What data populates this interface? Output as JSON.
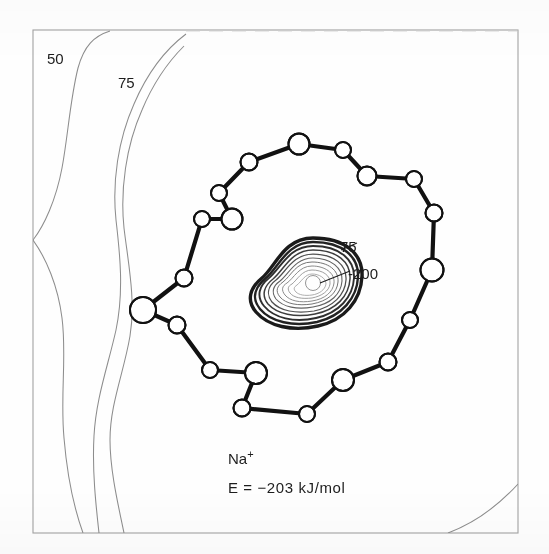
{
  "figure": {
    "kind": "contour-map-with-molecular-structure",
    "caption_species": "Na",
    "caption_charge": "+",
    "caption_energy": "E = −203 kJ/mol",
    "frame_color": "#9a9a9a",
    "bond_color": "#111111",
    "atom_fill": "#ffffff",
    "atom_stroke": "#111111",
    "contour_color": "#8d8d8d",
    "core_contour_color": "#1a1a1a"
  },
  "chart_data": {
    "type": "contour",
    "title": "",
    "xlabel": "",
    "ylabel": "",
    "units": "kJ/mol",
    "grid": false,
    "legend": "none",
    "annotations": [
      {
        "text": "50",
        "x": 56,
        "y": 57,
        "role": "contour-label",
        "leader": false
      },
      {
        "text": "75",
        "x": 126,
        "y": 81,
        "role": "contour-label",
        "leader": false
      },
      {
        "text": "75",
        "x": 346,
        "y": 247,
        "role": "contour-label",
        "leader": true
      },
      {
        "text": "-200",
        "x": 352,
        "y": 274,
        "role": "contour-label",
        "leader": true
      }
    ],
    "levels": [
      {
        "label": "50",
        "value": 50,
        "region": "outer-left",
        "style": "thin"
      },
      {
        "label": "75",
        "value": 75,
        "region": "outer-left",
        "style": "thin"
      },
      {
        "label": "75",
        "value": 75,
        "region": "core",
        "style": "thick"
      },
      {
        "label": "-200",
        "value": -200,
        "region": "core-center",
        "style": "thin"
      }
    ],
    "core_center": {
      "x": 313,
      "y": 283
    },
    "core_minimum_value": -200,
    "series": [
      {
        "name": "electrostatic potential contours",
        "values": [
          50,
          75,
          -200
        ]
      }
    ]
  },
  "structure": {
    "name": "crown-ether-macrocycle",
    "ring_size": 18,
    "atoms": [
      {
        "id": "O1",
        "element": "O",
        "x": 299,
        "y": 144,
        "r": 10.5
      },
      {
        "id": "C2",
        "element": "C",
        "x": 249,
        "y": 162,
        "r": 8.5
      },
      {
        "id": "C3",
        "element": "C",
        "x": 219,
        "y": 193,
        "r": 8.0
      },
      {
        "id": "O4",
        "element": "O",
        "x": 232,
        "y": 219,
        "r": 10.5
      },
      {
        "id": "C5",
        "element": "C",
        "x": 202,
        "y": 219,
        "r": 8.0
      },
      {
        "id": "C6",
        "element": "C",
        "x": 184,
        "y": 278,
        "r": 8.5
      },
      {
        "id": "O7",
        "element": "O",
        "x": 143,
        "y": 310,
        "r": 13.0
      },
      {
        "id": "C8",
        "element": "C",
        "x": 177,
        "y": 325,
        "r": 8.5
      },
      {
        "id": "C9",
        "element": "C",
        "x": 210,
        "y": 370,
        "r": 8.0
      },
      {
        "id": "O10",
        "element": "O",
        "x": 256,
        "y": 373,
        "r": 11.0
      },
      {
        "id": "C11",
        "element": "C",
        "x": 242,
        "y": 408,
        "r": 8.5
      },
      {
        "id": "C12",
        "element": "C",
        "x": 307,
        "y": 414,
        "r": 8.0
      },
      {
        "id": "O13",
        "element": "O",
        "x": 343,
        "y": 380,
        "r": 11.0
      },
      {
        "id": "C14",
        "element": "C",
        "x": 388,
        "y": 362,
        "r": 8.5
      },
      {
        "id": "C15",
        "element": "C",
        "x": 410,
        "y": 320,
        "r": 8.0
      },
      {
        "id": "O16",
        "element": "O",
        "x": 432,
        "y": 270,
        "r": 11.5
      },
      {
        "id": "C17",
        "element": "C",
        "x": 434,
        "y": 213,
        "r": 8.5
      },
      {
        "id": "C18",
        "element": "C",
        "x": 414,
        "y": 179,
        "r": 8.0
      },
      {
        "id": "C19",
        "element": "C",
        "x": 367,
        "y": 176,
        "r": 9.5
      },
      {
        "id": "C20",
        "element": "C",
        "x": 343,
        "y": 150,
        "r": 8.0
      }
    ],
    "bonds": [
      [
        "O1",
        "C2"
      ],
      [
        "C2",
        "C3"
      ],
      [
        "C3",
        "O4"
      ],
      [
        "O4",
        "C5"
      ],
      [
        "C5",
        "C6"
      ],
      [
        "C6",
        "O7"
      ],
      [
        "O7",
        "C8"
      ],
      [
        "C8",
        "C9"
      ],
      [
        "C9",
        "O10"
      ],
      [
        "O10",
        "C11"
      ],
      [
        "C11",
        "C12"
      ],
      [
        "C12",
        "O13"
      ],
      [
        "O13",
        "C14"
      ],
      [
        "C14",
        "C15"
      ],
      [
        "C15",
        "O16"
      ],
      [
        "O16",
        "C17"
      ],
      [
        "C17",
        "C18"
      ],
      [
        "C18",
        "C19"
      ],
      [
        "C19",
        "C20"
      ],
      [
        "C20",
        "O1"
      ]
    ]
  },
  "frame": {
    "left": 33,
    "top": 30,
    "right": 518,
    "bottom": 533
  }
}
